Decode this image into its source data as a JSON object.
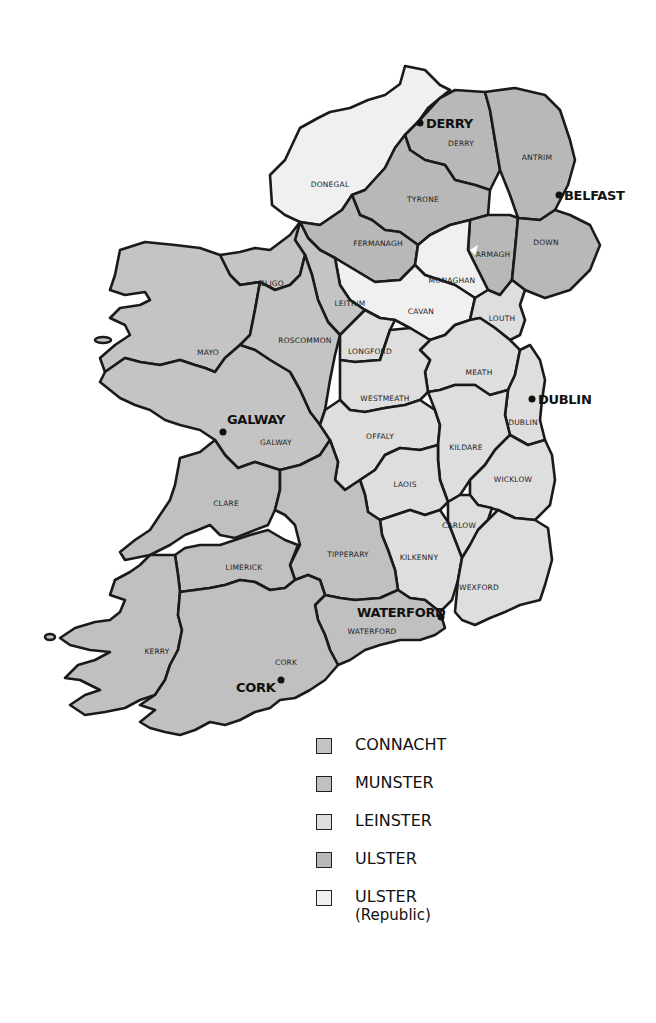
{
  "colors": {
    "connacht": "#c4c4c4",
    "munster": "#c0c0c0",
    "leinster": "#dedede",
    "ulster": "#b8b8b8",
    "ulster_republic": "#f0f0f0",
    "border": "#1a1a1a"
  },
  "counties": {
    "donegal": "DONEGAL",
    "derry": "DERRY",
    "antrim": "ANTRIM",
    "tyrone": "TYRONE",
    "fermanagh": "FERMANAGH",
    "armagh": "ARMAGH",
    "down": "DOWN",
    "monaghan": "MONAGHAN",
    "cavan": "CAVAN",
    "sligo": "SLIGO",
    "leitrim": "LEITRIM",
    "mayo": "MAYO",
    "roscommon": "ROSCOMMON",
    "longford": "LONGFORD",
    "louth": "LOUTH",
    "meath": "MEATH",
    "westmeath": "WESTMEATH",
    "galway": "GALWAY",
    "offaly": "OFFALY",
    "dublin": "DUBLIN",
    "kildare": "KILDARE",
    "laois": "LAOIS",
    "wicklow": "WICKLOW",
    "clare": "CLARE",
    "carlow": "CARLOW",
    "kilkenny": "KILKENNY",
    "tipperary": "TIPPERARY",
    "limerick": "LIMERICK",
    "wexford": "WEXFORD",
    "waterford": "WATERFORD",
    "kerry": "KERRY",
    "cork": "CORK"
  },
  "cities": {
    "derry": "DERRY",
    "belfast": "BELFAST",
    "dublin": "DUBLIN",
    "galway": "GALWAY",
    "waterford": "WATERFORD",
    "cork": "CORK"
  },
  "legend": [
    {
      "label": "CONNACHT",
      "sub": ""
    },
    {
      "label": "MUNSTER",
      "sub": ""
    },
    {
      "label": "LEINSTER",
      "sub": ""
    },
    {
      "label": "ULSTER",
      "sub": ""
    },
    {
      "label": "ULSTER",
      "sub": "(Republic)"
    }
  ]
}
